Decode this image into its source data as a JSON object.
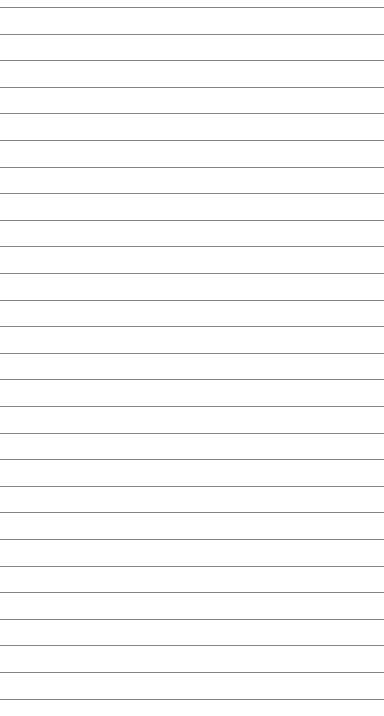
{
  "page": {
    "background": "#ffffff",
    "line_color": "#6e6e6e"
  },
  "lines": {
    "count": 27,
    "first_y": 7,
    "spacing": 26.6
  }
}
